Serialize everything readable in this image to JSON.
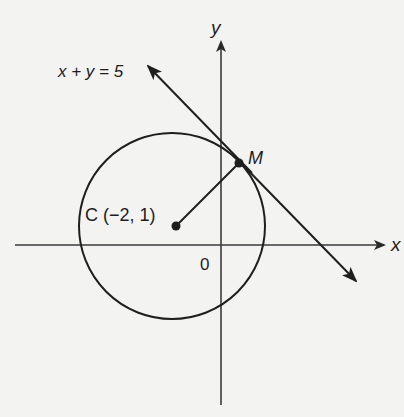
{
  "diagram": {
    "type": "coordinate-geometry",
    "colors": {
      "background": "#f3f3f1",
      "ink": "#1e1e1e",
      "axis": "#3a3a3a"
    },
    "axes": {
      "x_label": "x",
      "y_label": "y",
      "origin_label": "0"
    },
    "circle": {
      "center_label": "C (−2, 1)",
      "center": [
        -2,
        1
      ]
    },
    "tangent_point": {
      "label": "M"
    },
    "line": {
      "equation": "x + y = 5"
    },
    "segments": [
      {
        "from": "C",
        "to": "M",
        "kind": "radius"
      }
    ]
  }
}
